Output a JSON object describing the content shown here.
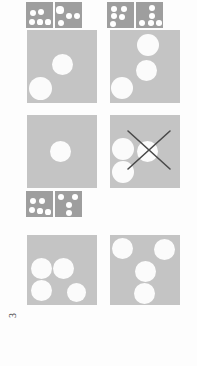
{
  "page": {
    "background_color": "#fdfdfd",
    "width": 197,
    "height": 366,
    "page_number": "3",
    "domino_color": "#9e9e9e",
    "card_color": "#c4c4c4",
    "pip_color": "#ffffff",
    "dot_color": "#fbfbfb",
    "xmark_color": "#4a4a4a"
  },
  "dominoes": [
    {
      "id": "domino-top-left",
      "x": 26,
      "y": 2,
      "half_w": 27,
      "half_h": 26,
      "gap": 2,
      "left": {
        "pip_count": 5,
        "layout": "five-custom",
        "pips": [
          {
            "cx": 7,
            "cy": 11,
            "r": 3.4
          },
          {
            "cx": 15,
            "cy": 10,
            "r": 3.4
          },
          {
            "cx": 6,
            "cy": 20,
            "r": 3.4
          },
          {
            "cx": 14,
            "cy": 20,
            "r": 2.6
          },
          {
            "cx": 22,
            "cy": 20,
            "r": 2.6
          }
        ]
      },
      "right": {
        "pip_count": 4,
        "layout": "four-custom",
        "pips": [
          {
            "cx": 5,
            "cy": 8,
            "r": 3.6
          },
          {
            "cx": 14,
            "cy": 14,
            "r": 3.2
          },
          {
            "cx": 22,
            "cy": 14,
            "r": 3.2
          },
          {
            "cx": 6,
            "cy": 21,
            "r": 3.0
          }
        ]
      }
    },
    {
      "id": "domino-top-right",
      "x": 107,
      "y": 2,
      "half_w": 27,
      "half_h": 26,
      "gap": 2,
      "left": {
        "pip_count": 5,
        "layout": "five-custom",
        "pips": [
          {
            "cx": 7,
            "cy": 7,
            "r": 3.2
          },
          {
            "cx": 17,
            "cy": 7,
            "r": 3.2
          },
          {
            "cx": 7,
            "cy": 14,
            "r": 3.2
          },
          {
            "cx": 15,
            "cy": 15,
            "r": 3.4
          },
          {
            "cx": 6,
            "cy": 22,
            "r": 3.2
          }
        ]
      },
      "right": {
        "pip_count": 5,
        "layout": "five-custom",
        "pips": [
          {
            "cx": 16,
            "cy": 6,
            "r": 3.4
          },
          {
            "cx": 16,
            "cy": 14,
            "r": 3.4
          },
          {
            "cx": 6,
            "cy": 21,
            "r": 3.2
          },
          {
            "cx": 15,
            "cy": 21,
            "r": 2.8
          },
          {
            "cx": 23,
            "cy": 21,
            "r": 2.8
          }
        ]
      }
    },
    {
      "id": "domino-middle-left",
      "x": 26,
      "y": 191,
      "half_w": 27,
      "half_h": 26,
      "gap": 2,
      "left": {
        "pip_count": 5,
        "layout": "five-custom",
        "pips": [
          {
            "cx": 7,
            "cy": 10,
            "r": 3.4
          },
          {
            "cx": 16,
            "cy": 10,
            "r": 3.4
          },
          {
            "cx": 6,
            "cy": 19,
            "r": 3.2
          },
          {
            "cx": 14,
            "cy": 20,
            "r": 2.6
          },
          {
            "cx": 22,
            "cy": 21,
            "r": 2.6
          }
        ]
      },
      "right": {
        "pip_count": 4,
        "layout": "four-custom",
        "pips": [
          {
            "cx": 6,
            "cy": 6,
            "r": 3.4
          },
          {
            "cx": 20,
            "cy": 6,
            "r": 3.4
          },
          {
            "cx": 14,
            "cy": 14,
            "r": 3.4
          },
          {
            "cx": 14,
            "cy": 22,
            "r": 3.2
          }
        ]
      }
    }
  ],
  "cards": [
    {
      "id": "card-row1-left",
      "x": 27,
      "y": 30,
      "w": 70,
      "h": 73,
      "dot_count": 2,
      "dots": [
        {
          "cx": 35,
          "cy": 34,
          "r": 10.5
        },
        {
          "cx": 13,
          "cy": 58,
          "r": 11.5
        }
      ],
      "crossed_out": false
    },
    {
      "id": "card-row1-right",
      "x": 110,
      "y": 30,
      "w": 70,
      "h": 73,
      "dot_count": 3,
      "dots": [
        {
          "cx": 38,
          "cy": 15,
          "r": 11.0
        },
        {
          "cx": 36,
          "cy": 40,
          "r": 10.5
        },
        {
          "cx": 12,
          "cy": 58,
          "r": 11.0
        }
      ],
      "crossed_out": false
    },
    {
      "id": "card-row2-left",
      "x": 27,
      "y": 115,
      "w": 70,
      "h": 73,
      "dot_count": 1,
      "dots": [
        {
          "cx": 33,
          "cy": 36,
          "r": 10.5
        }
      ],
      "crossed_out": false
    },
    {
      "id": "card-row2-right",
      "x": 110,
      "y": 115,
      "w": 70,
      "h": 73,
      "dot_count": 3,
      "dots": [
        {
          "cx": 13,
          "cy": 34,
          "r": 11.0
        },
        {
          "cx": 37,
          "cy": 36,
          "r": 10.5
        },
        {
          "cx": 13,
          "cy": 57,
          "r": 11.0
        }
      ],
      "crossed_out": true,
      "xmark": {
        "x1": 18,
        "y1": 16,
        "x2": 60,
        "y2": 54,
        "x3": 60,
        "y3": 16,
        "x4": 18,
        "y4": 54,
        "stroke_width": 1.6
      }
    },
    {
      "id": "card-row3-left",
      "x": 27,
      "y": 235,
      "w": 70,
      "h": 70,
      "dot_count": 4,
      "dots": [
        {
          "cx": 14,
          "cy": 33,
          "r": 10.5
        },
        {
          "cx": 36,
          "cy": 33,
          "r": 10.5
        },
        {
          "cx": 14,
          "cy": 55,
          "r": 10.5
        },
        {
          "cx": 49,
          "cy": 57,
          "r": 9.5
        }
      ],
      "crossed_out": false
    },
    {
      "id": "card-row3-right",
      "x": 110,
      "y": 235,
      "w": 70,
      "h": 70,
      "dot_count": 4,
      "dots": [
        {
          "cx": 12,
          "cy": 13,
          "r": 10.5
        },
        {
          "cx": 54,
          "cy": 14,
          "r": 10.5
        },
        {
          "cx": 35,
          "cy": 36,
          "r": 10.5
        },
        {
          "cx": 34,
          "cy": 58,
          "r": 10.5
        }
      ],
      "crossed_out": false
    }
  ]
}
